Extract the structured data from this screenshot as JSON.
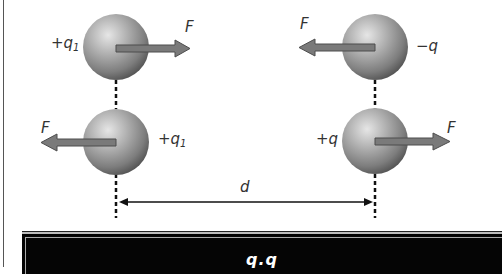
{
  "diagram": {
    "top_pair": {
      "left_charge": {
        "sign": "+",
        "symbol": "q",
        "subscript": "1",
        "force_label": "F",
        "force_direction": "right"
      },
      "right_charge": {
        "sign": "−",
        "symbol": "q",
        "subscript": "",
        "force_label": "F",
        "force_direction": "left"
      }
    },
    "bottom_pair": {
      "left_charge": {
        "sign": "+",
        "symbol": "q",
        "subscript": "1",
        "force_label": "F",
        "force_direction": "left"
      },
      "right_charge": {
        "sign": "+",
        "symbol": "q",
        "subscript": "",
        "force_label": "F",
        "force_direction": "right"
      }
    },
    "distance_label": "d",
    "formula_visible": "q₁q",
    "colors": {
      "sphere_light": "#d9d9d9",
      "sphere_dark": "#4a4a4a",
      "arrow_fill": "#7a7a7a",
      "arrow_stroke": "#4d4d4d",
      "formula_bg": "#050505"
    }
  },
  "labels": {
    "tl_charge_sign": "+q",
    "tl_charge_sub": "1",
    "tl_force": "F",
    "tr_charge": "−q",
    "tr_force": "F",
    "bl_charge_sign": "+q",
    "bl_charge_sub": "1",
    "bl_force": "F",
    "br_charge": "+q",
    "br_force": "F",
    "distance": "d",
    "formula": "q.q"
  }
}
